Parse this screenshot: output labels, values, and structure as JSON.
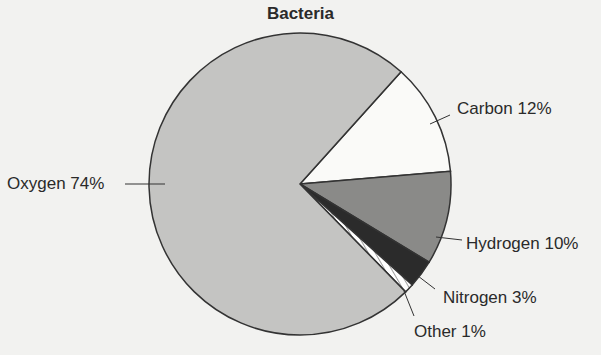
{
  "chart_data": {
    "type": "pie",
    "title": "Bacteria",
    "categories": [
      "Oxygen",
      "Carbon",
      "Hydrogen",
      "Nitrogen",
      "Other"
    ],
    "values": [
      74,
      12,
      10,
      3,
      1
    ],
    "unit": "%",
    "labels": [
      "Oxygen 74%",
      "Carbon 12%",
      "Hydrogen 10%",
      "Nitrogen 3%",
      "Other 1%"
    ],
    "colors": [
      "#c4c4c2",
      "#fafaf8",
      "#8a8a88",
      "#2b2b2b",
      "#ffffff"
    ],
    "legend": "none (direct leader-line labels)",
    "start_angle_deg": -48,
    "direction": "clockwise"
  },
  "labels": {
    "oxygen": "Oxygen  74%",
    "carbon": "Carbon  12%",
    "hydrogen": "Hydrogen  10%",
    "nitrogen": "Nitrogen  3%",
    "other": "Other  1%"
  }
}
